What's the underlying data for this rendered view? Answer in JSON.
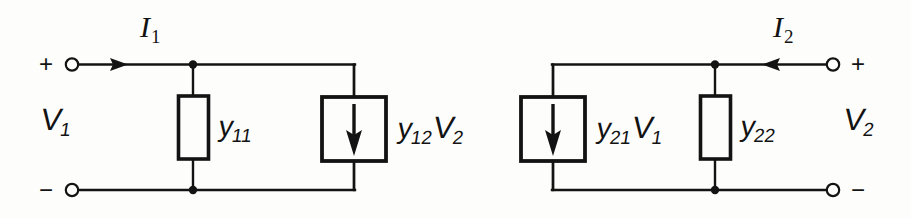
{
  "figure": {
    "kind": "circuit-schematic",
    "background_color": "#fdfdfc",
    "ink_color": "#131313"
  },
  "left_port": {
    "plus_sign": "+",
    "minus_sign": "−",
    "current_label": "I",
    "current_sub": "1",
    "voltage_label": "V",
    "voltage_sub": "1",
    "current_direction": "into-circuit-rightward"
  },
  "right_port": {
    "plus_sign": "+",
    "minus_sign": "−",
    "current_label": "I",
    "current_sub": "2",
    "voltage_label": "V",
    "voltage_sub": "2",
    "current_direction": "into-circuit-leftward"
  },
  "components": [
    {
      "id": "y11",
      "type": "admittance",
      "symbol": "y",
      "sub": "11",
      "shape": "rectangle-box",
      "port": "left"
    },
    {
      "id": "y12v2",
      "type": "dependent-current-source",
      "symbol": "y",
      "sub": "12",
      "factor_symbol": "V",
      "factor_sub": "2",
      "shape": "square-box-with-down-arrow",
      "arrow_direction": "down",
      "port": "left"
    },
    {
      "id": "y21v1",
      "type": "dependent-current-source",
      "symbol": "y",
      "sub": "21",
      "factor_symbol": "V",
      "factor_sub": "1",
      "shape": "square-box-with-down-arrow",
      "arrow_direction": "down",
      "port": "right"
    },
    {
      "id": "y22",
      "type": "admittance",
      "symbol": "y",
      "sub": "22",
      "shape": "rectangle-box",
      "port": "right"
    }
  ]
}
